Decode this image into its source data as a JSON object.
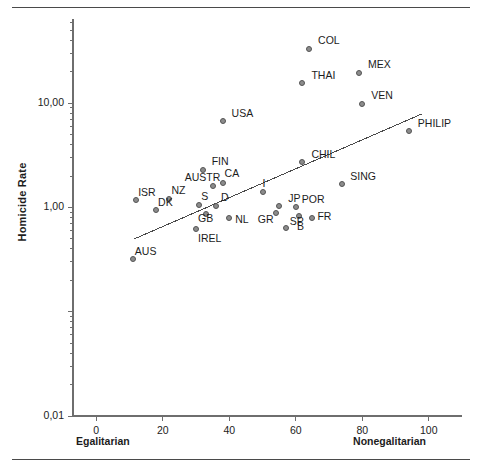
{
  "figure": {
    "top_rule": true,
    "bottom_rule": true
  },
  "chart_data": {
    "type": "scatter",
    "title": "",
    "xlabel": "",
    "ylabel": "Homicide Rate",
    "x_axis_left_label": "Egalitarian",
    "x_axis_right_label": "Nonegalitarian",
    "xlim": [
      -7,
      110
    ],
    "ylim": [
      0.01,
      60
    ],
    "yscale": "log",
    "grid": false,
    "legend": "none",
    "xticks": [
      0,
      20,
      40,
      60,
      80,
      100
    ],
    "xtick_labels": [
      "0",
      "20",
      "40",
      "60",
      "80",
      "100"
    ],
    "yticks": [
      10,
      1,
      0.01
    ],
    "ytick_labels": [
      "10,00",
      "1,00",
      "0,01"
    ],
    "marker_color": "#8c8c8c",
    "marker_edge_color": "#545454",
    "line_color": "#4a4a4a",
    "axis_color": "#6e6e6e",
    "points": [
      {
        "label": "COL",
        "x": 64,
        "y": 33.0,
        "lx": 9,
        "ly": -14
      },
      {
        "label": "MEX",
        "x": 79,
        "y": 19.5,
        "lx": 9,
        "ly": -14
      },
      {
        "label": "THAI",
        "x": 62,
        "y": 15.5,
        "lx": 9,
        "ly": -13
      },
      {
        "label": "VEN",
        "x": 80,
        "y": 9.9,
        "lx": 9,
        "ly": -14
      },
      {
        "label": "USA",
        "x": 38,
        "y": 6.8,
        "lx": 9,
        "ly": -13
      },
      {
        "label": "PHILIP",
        "x": 94,
        "y": 5.4,
        "lx": 9,
        "ly": -13
      },
      {
        "label": "CHIL",
        "x": 62,
        "y": 2.7,
        "lx": 9,
        "ly": -13
      },
      {
        "label": "FIN",
        "x": 32,
        "y": 2.3,
        "lx": 9,
        "ly": -14
      },
      {
        "label": "AUSTR",
        "x": 35,
        "y": 1.62,
        "lx": -28,
        "ly": -14
      },
      {
        "label": "CA",
        "x": 38,
        "y": 1.7,
        "lx": 2,
        "ly": -15
      },
      {
        "label": "SING",
        "x": 74,
        "y": 1.66,
        "lx": 8,
        "ly": -13
      },
      {
        "label": "I",
        "x": 50,
        "y": 1.4,
        "lx": 0,
        "ly": -14
      },
      {
        "label": "ISR",
        "x": 12,
        "y": 1.18,
        "lx": 2,
        "ly": -13
      },
      {
        "label": "NZ",
        "x": 22,
        "y": 1.2,
        "lx": 2,
        "ly": -14
      },
      {
        "label": "JP",
        "x": 55,
        "y": 1.04,
        "lx": 9,
        "ly": -13
      },
      {
        "label": "S",
        "x": 31,
        "y": 1.06,
        "lx": 2,
        "ly": -14
      },
      {
        "label": "D",
        "x": 36,
        "y": 1.03,
        "lx": 5,
        "ly": -14
      },
      {
        "label": "POR",
        "x": 60,
        "y": 1.02,
        "lx": 6,
        "ly": -13
      },
      {
        "label": "DK",
        "x": 18,
        "y": 0.95,
        "lx": 2,
        "ly": -13
      },
      {
        "label": "GR",
        "x": 54,
        "y": 0.88,
        "lx": -18,
        "ly": 1
      },
      {
        "label": "GB",
        "x": 33,
        "y": 0.86,
        "lx": -8,
        "ly": -1
      },
      {
        "label": "B",
        "x": 61,
        "y": 0.83,
        "lx": -2,
        "ly": 5
      },
      {
        "label": "FR",
        "x": 65,
        "y": 0.8,
        "lx": 5,
        "ly": -7
      },
      {
        "label": "NL",
        "x": 40,
        "y": 0.8,
        "lx": 6,
        "ly": -4
      },
      {
        "label": "SP",
        "x": 57,
        "y": 0.64,
        "lx": 4,
        "ly": -12
      },
      {
        "label": "IREL",
        "x": 30,
        "y": 0.62,
        "lx": 2,
        "ly": 4
      },
      {
        "label": "AUS",
        "x": 11,
        "y": 0.32,
        "lx": 2,
        "ly": -13
      }
    ],
    "trend_line": {
      "description": "least-squares regression line",
      "x_start": 11.5,
      "y_start": 0.5,
      "x_end": 98.0,
      "y_end": 7.9
    }
  }
}
